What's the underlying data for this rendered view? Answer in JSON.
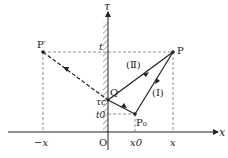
{
  "diagram": {
    "axes": {
      "horizontal_label": "x",
      "vertical_label": "τ",
      "origin_label": "O"
    },
    "points": {
      "P": "P",
      "P_prime": "P′",
      "P0": "P₀",
      "Q": "Q"
    },
    "tick_labels": {
      "t": "t",
      "tau_c": "τc",
      "t0": "t0",
      "neg_x": "−x",
      "x0": "x0",
      "x": "x"
    },
    "path_labels": {
      "path_I": "(Ⅰ)",
      "path_II": "(Ⅱ)"
    },
    "colors": {
      "line": "#222222",
      "dashed": "#666666",
      "hatch": "#555555"
    }
  }
}
